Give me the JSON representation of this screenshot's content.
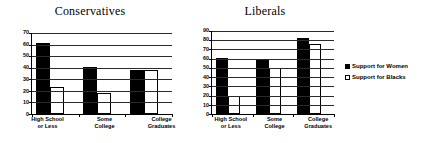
{
  "legend": {
    "position": "right",
    "entries": [
      {
        "label": "Support for Women",
        "swatch": "black",
        "color": "#000000"
      },
      {
        "label": "Support for Blacks",
        "swatch": "white",
        "color": "#ffffff"
      }
    ]
  },
  "chart_data": [
    {
      "type": "bar",
      "title": "Conservatives",
      "xlabel": "",
      "ylabel": "",
      "ylim": [
        0,
        70
      ],
      "yticks": [
        0,
        10,
        20,
        30,
        40,
        50,
        60,
        70
      ],
      "grid": true,
      "categories": [
        "High School\nor Less",
        "Some\nCollege",
        "College\nGraduates"
      ],
      "category_lines": [
        [
          "High School",
          "or Less"
        ],
        [
          "Some",
          "College"
        ],
        [
          "College",
          "Graduates"
        ]
      ],
      "series": [
        {
          "name": "Support for Women",
          "values": [
            61,
            41,
            38
          ]
        },
        {
          "name": "Support for Blacks",
          "values": [
            23,
            18,
            38
          ]
        }
      ]
    },
    {
      "type": "bar",
      "title": "Liberals",
      "xlabel": "",
      "ylabel": "",
      "ylim": [
        0,
        90
      ],
      "yticks": [
        0,
        10,
        20,
        30,
        40,
        50,
        60,
        70,
        80,
        90
      ],
      "grid": true,
      "categories": [
        "High School\nor Less",
        "Some\nCollege",
        "College\nGraduates"
      ],
      "category_lines": [
        [
          "High School",
          "or Less"
        ],
        [
          "Some",
          "College"
        ],
        [
          "College",
          "Graduates"
        ]
      ],
      "series": [
        {
          "name": "Support for Women",
          "values": [
            61,
            60,
            82
          ]
        },
        {
          "name": "Support for Blacks",
          "values": [
            20,
            50,
            76
          ]
        }
      ]
    }
  ]
}
